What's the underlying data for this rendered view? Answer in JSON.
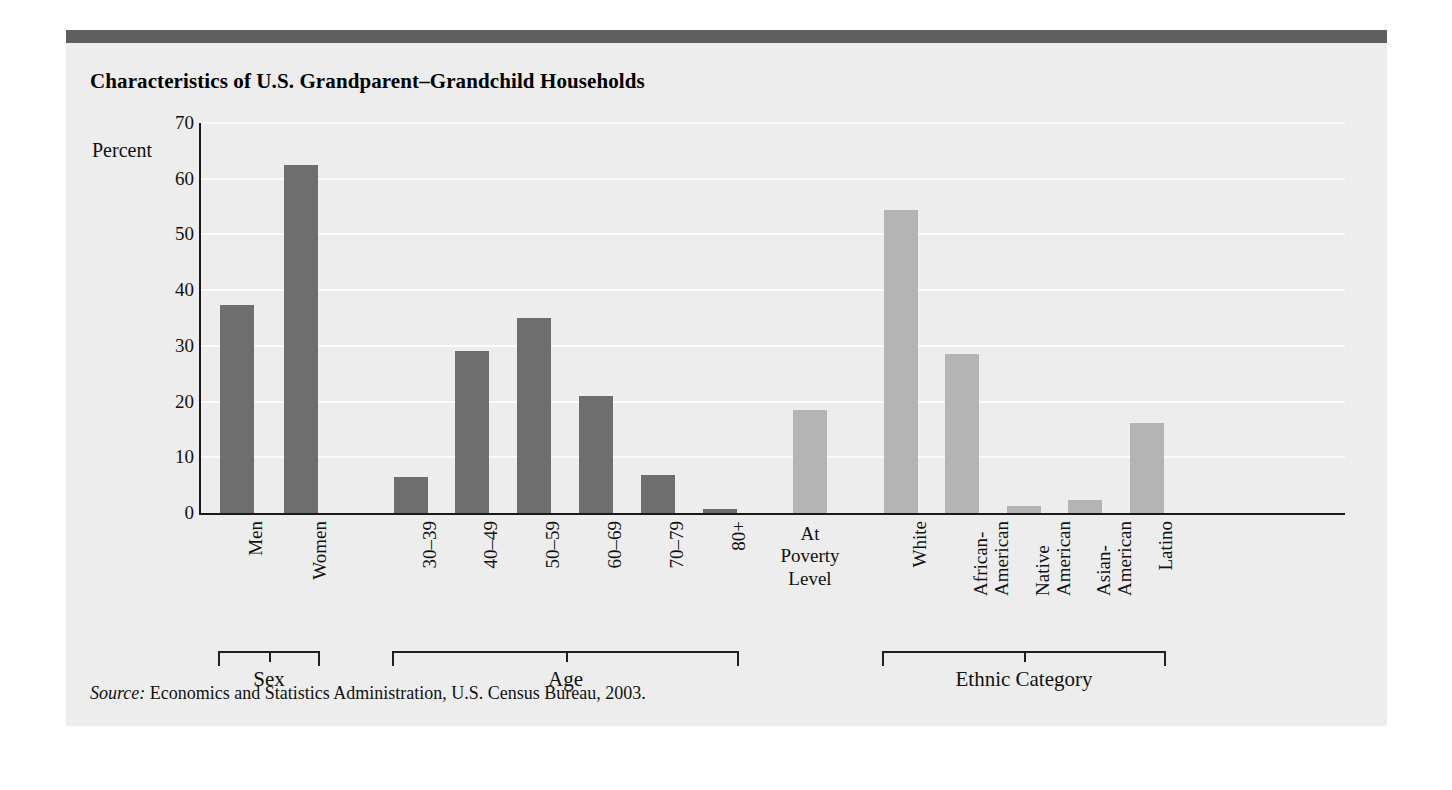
{
  "figure": {
    "title": "Characteristics of U.S. Grandparent–Grandchild Households",
    "source_prefix": "Source:",
    "source_text": " Economics and Statistics Administration, U.S. Census Bureau, 2003.",
    "accent_color": "#5e5e5e",
    "panel_color": "#ededed"
  },
  "chart_data": {
    "type": "bar",
    "title": "Characteristics of U.S. Grandparent–Grandchild Households",
    "xlabel": "",
    "ylabel": "Percent",
    "ylim": [
      0,
      70
    ],
    "yticks": [
      0,
      10,
      20,
      30,
      40,
      50,
      60,
      70
    ],
    "grid": true,
    "legend": "none",
    "categories": [
      "Men",
      "Women",
      "30–39",
      "40–49",
      "50–59",
      "60–69",
      "70–79",
      "80+",
      "At Poverty Level",
      "White",
      "African-American",
      "Native American",
      "Asian-American",
      "Latino"
    ],
    "values": [
      37.3,
      62.5,
      6.5,
      29.0,
      35.0,
      21.0,
      6.8,
      0.8,
      18.5,
      54.3,
      28.5,
      1.3,
      2.3,
      16.2
    ],
    "bar_colors": [
      "#6e6e6e",
      "#6e6e6e",
      "#6e6e6e",
      "#6e6e6e",
      "#6e6e6e",
      "#6e6e6e",
      "#6e6e6e",
      "#6e6e6e",
      "#b4b4b4",
      "#b4b4b4",
      "#b4b4b4",
      "#b4b4b4",
      "#b4b4b4",
      "#b4b4b4"
    ],
    "groups": [
      {
        "label": "Sex",
        "members": [
          "Men",
          "Women"
        ]
      },
      {
        "label": "Age",
        "members": [
          "30–39",
          "40–49",
          "50–59",
          "60–69",
          "70–79",
          "80+"
        ]
      },
      {
        "label": "Ethnic Category",
        "members": [
          "White",
          "African-American",
          "Native American",
          "Asian-American",
          "Latino"
        ]
      }
    ]
  },
  "bars": [
    {
      "label": "Men",
      "value": 37.3,
      "tone": "dark",
      "label_lines": [
        "Men"
      ],
      "rotated": true
    },
    {
      "label": "Women",
      "value": 62.5,
      "tone": "dark",
      "label_lines": [
        "Women"
      ],
      "rotated": true
    },
    {
      "label": "30–39",
      "value": 6.5,
      "tone": "dark",
      "label_lines": [
        "30–39"
      ],
      "rotated": true
    },
    {
      "label": "40–49",
      "value": 29.0,
      "tone": "dark",
      "label_lines": [
        "40–49"
      ],
      "rotated": true
    },
    {
      "label": "50–59",
      "value": 35.0,
      "tone": "dark",
      "label_lines": [
        "50–59"
      ],
      "rotated": true
    },
    {
      "label": "60–69",
      "value": 21.0,
      "tone": "dark",
      "label_lines": [
        "60–69"
      ],
      "rotated": true
    },
    {
      "label": "70–79",
      "value": 6.8,
      "tone": "dark",
      "label_lines": [
        "70–79"
      ],
      "rotated": true
    },
    {
      "label": "80+",
      "value": 0.8,
      "tone": "dark",
      "label_lines": [
        "80+"
      ],
      "rotated": true
    },
    {
      "label": "At Poverty Level",
      "value": 18.5,
      "tone": "light",
      "label_lines": [
        "At",
        "Poverty",
        "Level"
      ],
      "rotated": false
    },
    {
      "label": "White",
      "value": 54.3,
      "tone": "light",
      "label_lines": [
        "White"
      ],
      "rotated": true
    },
    {
      "label": "African-American",
      "value": 28.5,
      "tone": "light",
      "label_lines": [
        "African-",
        "American"
      ],
      "rotated": true
    },
    {
      "label": "Native American",
      "value": 1.3,
      "tone": "light",
      "label_lines": [
        "Native",
        "American"
      ],
      "rotated": true
    },
    {
      "label": "Asian-American",
      "value": 2.3,
      "tone": "light",
      "label_lines": [
        "Asian-",
        "American"
      ],
      "rotated": true
    },
    {
      "label": "Latino",
      "value": 16.2,
      "tone": "light",
      "label_lines": [
        "Latino"
      ],
      "rotated": true
    }
  ],
  "yticks": [
    70,
    60,
    50,
    40,
    30,
    20,
    10,
    0
  ],
  "y_axis_caption": "Percent",
  "brackets": [
    {
      "label": "Sex",
      "from": 0,
      "to": 1
    },
    {
      "label": "Age",
      "from": 2,
      "to": 7
    },
    {
      "label": "Ethnic Category",
      "from": 9,
      "to": 13
    }
  ]
}
